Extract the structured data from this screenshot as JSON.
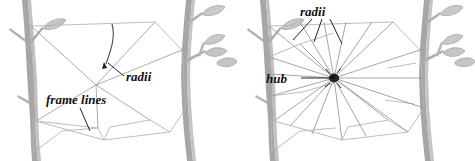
{
  "figure": {
    "background_color": "#ffffff",
    "panel_count": 2
  },
  "colors": {
    "background": "#ffffff",
    "branch": "#9a9a9a",
    "branch_shade": "#b9b9b9",
    "branch_dark": "#7e7e7e",
    "leaf_fill": "#c9c9c9",
    "leaf_stroke": "#a0a0a0",
    "silk_light": "#cfcfcf",
    "silk_mid": "#9d9d9d",
    "silk_dark": "#5a5a5a",
    "hub": "#1a1a1a",
    "label": "#111111",
    "leader": "#222222"
  },
  "panels": [
    {
      "id": "panel-left",
      "name": "frame-and-first-radii",
      "labels": [
        {
          "id": "frame-lines",
          "text": "frame lines",
          "x": 46,
          "y": 104,
          "font_size": 13,
          "leader_from": [
            80,
            108
          ],
          "leader_to": [
            90,
            131
          ]
        },
        {
          "id": "radii",
          "text": "radii",
          "x": 126,
          "y": 80,
          "font_size": 13,
          "leader_from": [
            124,
            76
          ],
          "leader_to": [
            108,
            63
          ]
        }
      ]
    },
    {
      "id": "panel-right",
      "name": "completed-radii-and-hub",
      "labels": [
        {
          "id": "radii",
          "text": "radii",
          "x": 73,
          "y": 15,
          "font_size": 13,
          "leaders": [
            [
              [
                74,
                19
              ],
              [
                55,
                40
              ]
            ],
            [
              [
                84,
                19
              ],
              [
                76,
                42
              ]
            ],
            [
              [
                92,
                19
              ],
              [
                104,
                44
              ]
            ]
          ]
        },
        {
          "id": "hub",
          "text": "hub",
          "x": 30,
          "y": 82,
          "font_size": 13,
          "leader_from": [
            62,
            78
          ],
          "leader_to": [
            96,
            78
          ]
        }
      ]
    }
  ],
  "diagram_parts": {
    "frame_lines_label": "frame lines",
    "radii_label": "radii",
    "hub_label": "hub"
  }
}
